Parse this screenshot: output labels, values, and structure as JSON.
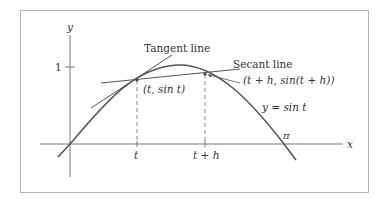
{
  "diagram": {
    "axes": {
      "x_label": "x",
      "y_label": "y",
      "y_tick_label": "1",
      "x_tick_labels": [
        "t",
        "t + h"
      ],
      "pi_label": "π"
    },
    "curve": {
      "label": "y = sin t",
      "function": "sin"
    },
    "lines": {
      "tangent_label": "Tangent line",
      "secant_label": "Secant line"
    },
    "points": {
      "p1_label": "(t, sin t)",
      "p2_label": "(t + h, sin(t + h))"
    },
    "colors": {
      "frame": "#b5b5b5",
      "axis": "#777777",
      "curve": "#555555",
      "line": "#555555",
      "text": "#333333"
    }
  }
}
